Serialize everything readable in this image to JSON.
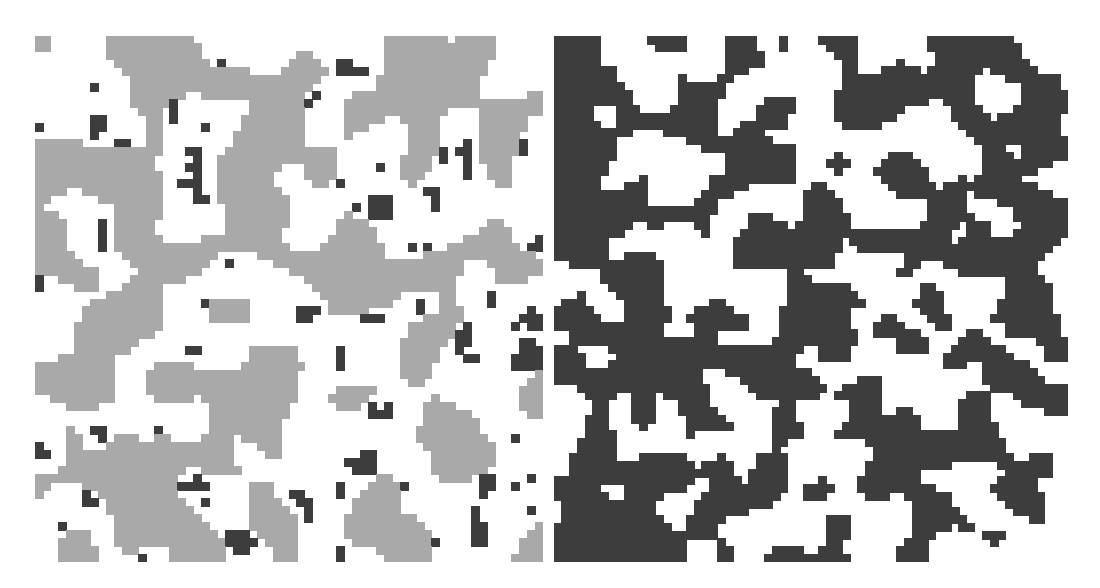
{
  "figure": {
    "panels": [
      {
        "id": "left",
        "description": "Lattice simulation snapshot with three states: white background, light-gray large domains, dark-gray small clusters",
        "colors": {
          "background": "#ffffff",
          "state_a": "#a9a9a9",
          "state_b": "#3d3d3d"
        },
        "grid": {
          "cols": 64,
          "rows": 66
        },
        "seed": 17,
        "mode": "three-state"
      },
      {
        "id": "right",
        "description": "Lattice simulation snapshot with two states: white and dark-gray percolating labyrinth pattern",
        "colors": {
          "background": "#ffffff",
          "state_b": "#3d3d3d"
        },
        "grid": {
          "cols": 66,
          "rows": 68
        },
        "seed": 41,
        "mode": "two-state"
      }
    ]
  }
}
